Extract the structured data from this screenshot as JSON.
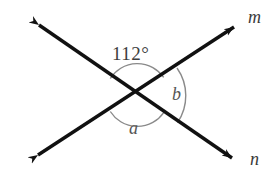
{
  "figure": {
    "type": "geometry-diagram",
    "background_color": "#ffffff",
    "line_color": "#111111",
    "arc_color": "#8a8a8a",
    "label_color": "#3d3d3d",
    "variable_color": "#555555",
    "labels": {
      "angle_measure": "112°",
      "angle_a": "a",
      "angle_b": "b",
      "line_m": "m",
      "line_n": "n"
    },
    "geometry": {
      "intersection": [
        137,
        95
      ],
      "line_1_name": "m",
      "line_1_endpoints": [
        [
          32,
          160
        ],
        [
          240,
          22
        ]
      ],
      "line_2_name": "n",
      "line_2_endpoints": [
        [
          33,
          20
        ],
        [
          238,
          163
        ]
      ],
      "arc_top_radius": 32,
      "arc_right_radius": 48,
      "arc_bottom_radius": 32,
      "known_angle_degrees": 112,
      "angle_a_degrees": 112,
      "angle_b_degrees": 68
    }
  }
}
